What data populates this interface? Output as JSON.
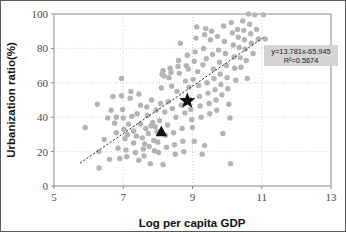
{
  "chart_data": {
    "type": "scatter",
    "title": "",
    "xlabel": "Log per capita GDP",
    "ylabel": "Urbanization ratio(%)",
    "xlim": [
      5,
      13
    ],
    "ylim": [
      0,
      100
    ],
    "xticks": [
      5,
      7,
      9,
      11,
      13
    ],
    "yticks": [
      0,
      20,
      40,
      60,
      80,
      100
    ],
    "grid": true,
    "legend": "none",
    "annotations": [
      {
        "name": "regression-equation",
        "text": "y=13.781x-65.945"
      },
      {
        "name": "r-squared",
        "text": "R²=0.5674"
      }
    ],
    "trendline": {
      "type": "linear",
      "slope": 13.781,
      "intercept": -65.945,
      "r_squared": 0.5674,
      "style": "dashed",
      "x_start": 5.75,
      "x_end": 11.05
    },
    "highlight_points": [
      {
        "name": "star-marker",
        "marker": "star",
        "x": 8.85,
        "y": 49.5,
        "color": "#111111"
      },
      {
        "name": "triangle-marker",
        "marker": "triangle",
        "x": 8.1,
        "y": 31.5,
        "color": "#111111"
      }
    ],
    "series": [
      {
        "name": "countries",
        "marker": "circle",
        "color": "#b4b4b4",
        "points": [
          [
            5.9,
            34.0
          ],
          [
            6.25,
            47.5
          ],
          [
            6.3,
            10.5
          ],
          [
            6.3,
            20.0
          ],
          [
            6.55,
            39.5
          ],
          [
            6.6,
            15.5
          ],
          [
            6.65,
            44.0
          ],
          [
            6.7,
            52.0
          ],
          [
            6.75,
            36.5
          ],
          [
            6.8,
            40.0
          ],
          [
            6.8,
            31.0
          ],
          [
            6.85,
            22.0
          ],
          [
            6.9,
            16.0
          ],
          [
            6.95,
            62.5
          ],
          [
            6.95,
            52.5
          ],
          [
            6.98,
            44.5
          ],
          [
            7.0,
            39.5
          ],
          [
            7.02,
            33.0
          ],
          [
            7.05,
            27.5
          ],
          [
            7.08,
            21.0
          ],
          [
            7.1,
            17.0
          ],
          [
            7.12,
            30.0
          ],
          [
            7.15,
            36.0
          ],
          [
            7.2,
            51.0
          ],
          [
            7.22,
            55.0
          ],
          [
            7.25,
            40.5
          ],
          [
            7.3,
            32.0
          ],
          [
            7.3,
            25.0
          ],
          [
            7.35,
            19.5
          ],
          [
            7.38,
            29.0
          ],
          [
            7.4,
            42.0
          ],
          [
            7.45,
            53.5
          ],
          [
            7.5,
            47.0
          ],
          [
            7.5,
            36.0
          ],
          [
            7.55,
            28.0
          ],
          [
            7.58,
            21.5
          ],
          [
            7.6,
            17.5
          ],
          [
            7.62,
            24.5
          ],
          [
            7.65,
            33.5
          ],
          [
            7.68,
            46.0
          ],
          [
            7.7,
            41.0
          ],
          [
            7.72,
            30.5
          ],
          [
            7.75,
            23.0
          ],
          [
            7.78,
            13.0
          ],
          [
            7.8,
            35.0
          ],
          [
            7.82,
            50.0
          ],
          [
            7.85,
            37.0
          ],
          [
            7.88,
            26.5
          ],
          [
            7.9,
            20.5
          ],
          [
            7.92,
            34.5
          ],
          [
            7.95,
            44.0
          ],
          [
            7.98,
            31.5
          ],
          [
            8.0,
            25.5
          ],
          [
            8.02,
            19.5
          ],
          [
            8.05,
            38.0
          ],
          [
            8.08,
            48.0
          ],
          [
            8.1,
            57.0
          ],
          [
            8.12,
            65.0
          ],
          [
            8.15,
            67.0
          ],
          [
            8.18,
            64.0
          ],
          [
            8.2,
            43.0
          ],
          [
            8.22,
            29.5
          ],
          [
            8.25,
            22.5
          ],
          [
            8.28,
            35.5
          ],
          [
            8.3,
            49.0
          ],
          [
            8.32,
            63.0
          ],
          [
            8.35,
            68.5
          ],
          [
            8.38,
            66.0
          ],
          [
            8.4,
            58.0
          ],
          [
            8.42,
            45.0
          ],
          [
            8.45,
            31.0
          ],
          [
            8.48,
            24.0
          ],
          [
            8.5,
            18.5
          ],
          [
            8.52,
            40.0
          ],
          [
            8.55,
            55.0
          ],
          [
            8.58,
            69.5
          ],
          [
            8.6,
            73.0
          ],
          [
            8.62,
            65.5
          ],
          [
            8.65,
            83.0
          ],
          [
            8.68,
            47.0
          ],
          [
            8.7,
            33.5
          ],
          [
            8.72,
            26.0
          ],
          [
            8.75,
            20.0
          ],
          [
            8.78,
            42.5
          ],
          [
            8.8,
            61.0
          ],
          [
            8.82,
            70.0
          ],
          [
            8.85,
            76.0
          ],
          [
            8.88,
            68.0
          ],
          [
            8.9,
            57.5
          ],
          [
            8.92,
            50.5
          ],
          [
            8.95,
            44.5
          ],
          [
            8.98,
            38.5
          ],
          [
            9.0,
            34.0
          ],
          [
            9.02,
            62.0
          ],
          [
            9.05,
            72.5
          ],
          [
            9.08,
            78.0
          ],
          [
            9.1,
            86.0
          ],
          [
            9.12,
            92.5
          ],
          [
            9.15,
            66.5
          ],
          [
            9.18,
            58.5
          ],
          [
            9.2,
            52.0
          ],
          [
            9.22,
            46.5
          ],
          [
            9.25,
            40.0
          ],
          [
            9.28,
            18.5
          ],
          [
            9.3,
            70.5
          ],
          [
            9.32,
            80.0
          ],
          [
            9.35,
            88.0
          ],
          [
            9.38,
            91.5
          ],
          [
            9.4,
            74.0
          ],
          [
            9.42,
            60.0
          ],
          [
            9.45,
            54.0
          ],
          [
            9.48,
            48.0
          ],
          [
            9.5,
            42.0
          ],
          [
            9.52,
            85.0
          ],
          [
            9.55,
            90.0
          ],
          [
            9.58,
            76.5
          ],
          [
            9.6,
            68.0
          ],
          [
            9.62,
            62.5
          ],
          [
            9.65,
            56.0
          ],
          [
            9.68,
            50.0
          ],
          [
            9.7,
            44.0
          ],
          [
            9.72,
            87.0
          ],
          [
            9.75,
            79.0
          ],
          [
            9.78,
            72.0
          ],
          [
            9.8,
            65.0
          ],
          [
            9.82,
            59.0
          ],
          [
            9.85,
            53.0
          ],
          [
            9.88,
            30.5
          ],
          [
            9.9,
            93.0
          ],
          [
            9.92,
            84.0
          ],
          [
            9.95,
            77.0
          ],
          [
            9.98,
            70.0
          ],
          [
            10.0,
            63.0
          ],
          [
            10.02,
            56.5
          ],
          [
            10.05,
            47.5
          ],
          [
            10.08,
            39.5
          ],
          [
            10.1,
            13.0
          ],
          [
            10.12,
            95.0
          ],
          [
            10.15,
            89.0
          ],
          [
            10.18,
            82.0
          ],
          [
            10.2,
            75.0
          ],
          [
            10.22,
            68.5
          ],
          [
            10.25,
            61.5
          ],
          [
            10.3,
            91.0
          ],
          [
            10.32,
            86.5
          ],
          [
            10.35,
            80.5
          ],
          [
            10.38,
            74.5
          ],
          [
            10.4,
            69.0
          ],
          [
            10.45,
            96.0
          ],
          [
            10.48,
            90.5
          ],
          [
            10.5,
            85.0
          ],
          [
            10.52,
            79.5
          ],
          [
            10.55,
            73.0
          ],
          [
            10.58,
            62.5
          ],
          [
            10.62,
            100.0
          ],
          [
            10.65,
            94.0
          ],
          [
            10.68,
            88.5
          ],
          [
            10.7,
            83.0
          ],
          [
            10.75,
            77.0
          ],
          [
            10.8,
            99.5
          ],
          [
            10.85,
            91.0
          ],
          [
            10.9,
            85.5
          ],
          [
            11.05,
            99.5
          ],
          [
            11.1,
            85.5
          ],
          [
            9.05,
            26.0
          ],
          [
            9.35,
            23.5
          ],
          [
            8.15,
            12.5
          ],
          [
            7.45,
            15.0
          ],
          [
            6.45,
            27.0
          ]
        ]
      }
    ]
  },
  "axis": {
    "x_title": "Log per capita GDP",
    "y_title": "Urbanization ratio(%)",
    "x_tick_labels": [
      "5",
      "7",
      "9",
      "11",
      "13"
    ],
    "y_tick_labels": [
      "0",
      "20",
      "40",
      "60",
      "80",
      "100"
    ]
  },
  "annotation_box": {
    "line1": "y=13.781x-65.945",
    "line2": "R²=0.5674",
    "background": "#d4d4d4"
  },
  "colors": {
    "point": "#b4b4b4",
    "marker": "#111111",
    "grid": "#c8c8c8",
    "axis": "#8a8a8a",
    "border": "#5a5a5a"
  }
}
